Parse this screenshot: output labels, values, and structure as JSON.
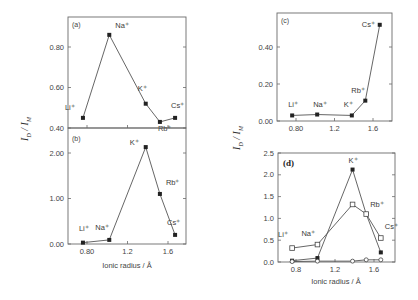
{
  "figure": {
    "ylabel": "I_D / I_M",
    "xlabel": "Ionic radius / Å"
  },
  "panels": {
    "a": {
      "label": "(a)"
    },
    "b": {
      "label": "(b)"
    },
    "c": {
      "label": "(c)"
    },
    "d": {
      "label": "(d)"
    }
  },
  "chart_data": [
    {
      "id": "a",
      "type": "line",
      "title": "(a)",
      "xlabel": "",
      "ylabel": "I_D / I_M",
      "categories": [
        "Li+",
        "Na+",
        "K+",
        "Rb+",
        "Cs+"
      ],
      "x": [
        0.76,
        1.02,
        1.38,
        1.52,
        1.67
      ],
      "series": [
        {
          "name": "filled circles",
          "marker": "filled-circle",
          "values": [
            0.45,
            0.86,
            0.52,
            0.43,
            0.45
          ]
        }
      ],
      "yticks": [
        "0.40",
        "0.60",
        "0.80"
      ],
      "ylim": [
        0.4,
        0.95
      ],
      "xticks": [
        0.8,
        1.2,
        1.6
      ],
      "xlim": [
        0.6,
        1.78
      ],
      "grid": false
    },
    {
      "id": "b",
      "type": "line",
      "title": "(b)",
      "xlabel": "Ionic radius / Å",
      "ylabel": "I_D / I_M",
      "categories": [
        "Li+",
        "Na+",
        "K+",
        "Rb+",
        "Cs+"
      ],
      "x": [
        0.76,
        1.02,
        1.38,
        1.52,
        1.67
      ],
      "series": [
        {
          "name": "filled circles",
          "marker": "filled-circle",
          "values": [
            0.03,
            0.09,
            2.13,
            1.1,
            0.2
          ]
        }
      ],
      "yticks": [
        "0.00",
        "1.00",
        "2.00"
      ],
      "xticks": [
        "0.80",
        "1.2",
        "1.6"
      ],
      "ylim": [
        0.0,
        2.5
      ],
      "xlim": [
        0.6,
        1.78
      ],
      "grid": false
    },
    {
      "id": "c",
      "type": "line",
      "title": "(c)",
      "xlabel": "",
      "ylabel": "I_D / I_M",
      "categories": [
        "Li+",
        "Na+",
        "K+",
        "Rb+",
        "Cs+"
      ],
      "x": [
        0.76,
        1.02,
        1.38,
        1.52,
        1.67
      ],
      "series": [
        {
          "name": "filled circles",
          "marker": "filled-circle",
          "values": [
            0.03,
            0.035,
            0.03,
            0.11,
            0.52
          ]
        }
      ],
      "yticks": [
        "0.00",
        "0.20",
        "0.40"
      ],
      "xticks": [
        "0.80",
        "1.2",
        "1.6"
      ],
      "ylim": [
        0.0,
        0.58
      ],
      "xlim": [
        0.6,
        1.78
      ],
      "grid": false
    },
    {
      "id": "d",
      "type": "line",
      "title": "(d)",
      "xlabel": "Ionic radius / Å",
      "ylabel": "I_D / I_M",
      "categories": [
        "Li+",
        "Na+",
        "K+",
        "Rb+",
        "Cs+"
      ],
      "x": [
        0.76,
        1.02,
        1.38,
        1.52,
        1.67
      ],
      "series": [
        {
          "name": "filled circles",
          "marker": "filled-circle",
          "values": [
            0.03,
            0.09,
            2.12,
            1.1,
            0.22
          ]
        },
        {
          "name": "open squares",
          "marker": "open-square",
          "values": [
            0.32,
            0.4,
            1.32,
            1.1,
            0.55
          ]
        },
        {
          "name": "open circles",
          "marker": "open-circle",
          "values": [
            0.01,
            0.02,
            0.02,
            0.05,
            0.05
          ]
        }
      ],
      "yticks": [
        "0.0",
        "0.5",
        "1.0",
        "1.5",
        "2.0",
        "2.5"
      ],
      "xticks": [
        "0.8",
        "1.2",
        "1.6"
      ],
      "ylim": [
        0.0,
        2.5
      ],
      "xlim": [
        0.6,
        1.78
      ],
      "grid": false
    }
  ]
}
